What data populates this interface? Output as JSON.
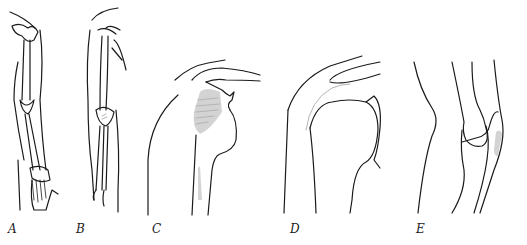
{
  "figure": {
    "panels": [
      {
        "id": "A",
        "label": "A",
        "subject": "arm-skeleton-anterior"
      },
      {
        "id": "B",
        "label": "B",
        "subject": "arm-skeleton-lateral"
      },
      {
        "id": "C",
        "label": "C",
        "subject": "shoulder-with-shaded-region"
      },
      {
        "id": "D",
        "label": "D",
        "subject": "shoulder-with-hatched-line"
      },
      {
        "id": "E",
        "label": "E",
        "subject": "elbow-profile-with-shaded-region"
      }
    ],
    "colors": {
      "line": "#1a1a1a",
      "shading": "#b5b5b5",
      "background": "#ffffff"
    }
  }
}
